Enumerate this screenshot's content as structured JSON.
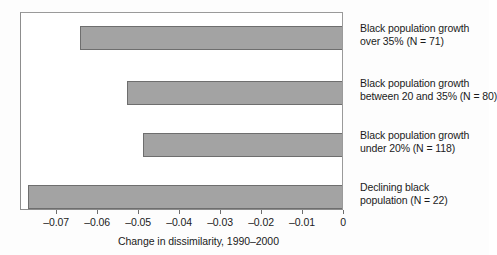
{
  "chart_data": {
    "type": "bar",
    "orientation": "horizontal",
    "title": "",
    "xlabel": "Change in dissimilarity, 1990–2000",
    "ylabel": "",
    "xlim": [
      -0.0788,
      0
    ],
    "grid": false,
    "legend": null,
    "xticks": [
      -0.07,
      -0.06,
      -0.05,
      -0.04,
      -0.03,
      -0.02,
      -0.01,
      0
    ],
    "xticklabels": [
      "–0.07",
      "–0.06",
      "–0.05",
      "–0.04",
      "–0.03",
      "–0.02",
      "–0.01",
      "0"
    ],
    "categories": [
      "Black population growth over 35% (N = 71)",
      "Black population growth between 20 and 35% (N = 80)",
      "Black population growth under 20% (N = 118)",
      "Declining black population (N = 22)"
    ],
    "category_lines": [
      [
        "Black population growth",
        "over 35% (N = 71)"
      ],
      [
        "Black population growth",
        "between 20 and 35% (N = 80)"
      ],
      [
        "Black population growth",
        "under 20% (N = 118)"
      ],
      [
        "Declining black",
        "population (N = 22)"
      ]
    ],
    "values": [
      -0.0645,
      -0.053,
      -0.049,
      -0.077
    ],
    "bar_color": "#a3a3a3",
    "bar_edge_color": "#6e6e6e",
    "axis_color": "#8d8d8d",
    "background": "#ffffff"
  }
}
